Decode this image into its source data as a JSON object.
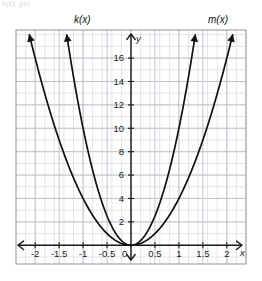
{
  "figure": {
    "corner_note": "h(x), j(x)",
    "background_color": "#ffffff",
    "grid_color": "#b9bfc9",
    "grid_minor_color": "#d6dae1",
    "axis_color": "#1a1a1a",
    "curve_color": "#111111",
    "frame_color": "#8d939c"
  },
  "labels": {
    "k_label": "k(x)",
    "m_label": "m(x)",
    "x_axis_letter": "x",
    "y_axis_letter": "y",
    "origin_label": "0"
  },
  "chart_data": {
    "type": "line",
    "title": "",
    "subtitle": "",
    "xlabel": "x",
    "ylabel": "y",
    "xlim": [
      -2.4,
      2.4
    ],
    "ylim": [
      -1.6,
      18.4
    ],
    "grid": true,
    "grid_step_x": 0.2,
    "grid_step_y": 1,
    "legend_position": "above-plot",
    "xticks": [
      -2,
      -1.5,
      -1,
      -0.5,
      0,
      0.5,
      1,
      1.5,
      2
    ],
    "xticklabels": [
      "-2",
      "-1.5",
      "-1",
      "-0.5",
      "0",
      "0.5",
      "1",
      "1.5",
      "2"
    ],
    "yticks": [
      2,
      4,
      6,
      8,
      10,
      12,
      14,
      16
    ],
    "yticklabels": [
      "2",
      "4",
      "6",
      "8",
      "10",
      "12",
      "14",
      "16"
    ],
    "annotations": [
      {
        "text": "k(x)",
        "x": -1.35,
        "y": 19.6
      },
      {
        "text": "m(x)",
        "x": 2.1,
        "y": 19.6
      }
    ],
    "series": [
      {
        "name": "outer-left-parabola",
        "equation": "y = 4x^2",
        "coefficient": 4,
        "vertex": [
          0,
          0
        ],
        "arrow_end": [
          -2.12,
          18.0
        ],
        "points": [
          [
            0,
            0
          ],
          [
            -0.25,
            0.25
          ],
          [
            -0.5,
            1
          ],
          [
            -0.75,
            2.25
          ],
          [
            -1,
            4
          ],
          [
            -1.25,
            6.25
          ],
          [
            -1.5,
            9
          ],
          [
            -1.75,
            12.25
          ],
          [
            -2,
            16
          ],
          [
            -2.12,
            18.0
          ]
        ]
      },
      {
        "name": "inner-left-parabola",
        "equation": "y = 10x^2",
        "coefficient": 10,
        "vertex": [
          0,
          0
        ],
        "arrow_end": [
          -1.34,
          18.0
        ],
        "points": [
          [
            0,
            0
          ],
          [
            -0.2,
            0.4
          ],
          [
            -0.4,
            1.6
          ],
          [
            -0.6,
            3.6
          ],
          [
            -0.8,
            6.4
          ],
          [
            -1,
            10
          ],
          [
            -1.2,
            14.4
          ],
          [
            -1.34,
            18.0
          ]
        ]
      },
      {
        "name": "inner-right-parabola",
        "equation": "y = 10x^2",
        "coefficient": 10,
        "vertex": [
          0,
          0
        ],
        "arrow_end": [
          1.34,
          18.0
        ],
        "points": [
          [
            0,
            0
          ],
          [
            0.2,
            0.4
          ],
          [
            0.4,
            1.6
          ],
          [
            0.6,
            3.6
          ],
          [
            0.8,
            6.4
          ],
          [
            1,
            10
          ],
          [
            1.2,
            14.4
          ],
          [
            1.34,
            18.0
          ]
        ]
      },
      {
        "name": "outer-right-parabola",
        "equation": "y = 4x^2",
        "coefficient": 4,
        "vertex": [
          0,
          0
        ],
        "arrow_end": [
          2.12,
          18.0
        ],
        "points": [
          [
            0,
            0
          ],
          [
            0.25,
            0.25
          ],
          [
            0.5,
            1
          ],
          [
            0.75,
            2.25
          ],
          [
            1,
            4
          ],
          [
            1.25,
            6.25
          ],
          [
            1.5,
            9
          ],
          [
            1.75,
            12.25
          ],
          [
            2,
            16
          ],
          [
            2.12,
            18.0
          ]
        ]
      }
    ]
  }
}
